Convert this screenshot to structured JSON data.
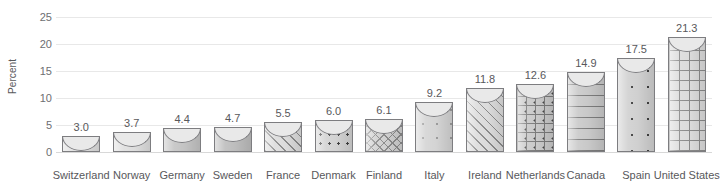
{
  "chart_data": {
    "type": "bar",
    "title": "",
    "xlabel": "",
    "ylabel": "Percent",
    "ylim": [
      0,
      25
    ],
    "yticks": [
      0,
      5,
      10,
      15,
      20,
      25
    ],
    "ytick_labels": [
      "0",
      "5",
      "10",
      "15",
      "20",
      "25"
    ],
    "grid": true,
    "legend": "none",
    "categories": [
      "Switzerland",
      "Norway",
      "Germany",
      "Sweden",
      "France",
      "Denmark",
      "Finland",
      "Italy",
      "Ireland",
      "Netherlands",
      "Canada",
      "Spain",
      "United States"
    ],
    "values": [
      3.0,
      3.7,
      4.4,
      4.7,
      5.5,
      6.0,
      6.1,
      9.2,
      11.8,
      12.6,
      14.9,
      17.5,
      21.3
    ],
    "value_labels": [
      "3.0",
      "3.7",
      "4.4",
      "4.7",
      "5.5",
      "6.0",
      "6.1",
      "9.2",
      "11.8",
      "12.6",
      "14.9",
      "17.5",
      "21.3"
    ],
    "bar_patterns": [
      "plain-light",
      "plain-light",
      "solid-medium",
      "solid-dark",
      "diagonal-stripes",
      "dots",
      "diagonal-crosshatch",
      "plus-marks",
      "diagonal-stripes-wide",
      "grid-with-dots",
      "horizontal-lines",
      "sparse-dots",
      "fine-grid"
    ]
  },
  "colors": {
    "text": "#58585b",
    "gridline": "#e8e8e8",
    "baseline": "#d8d8d8",
    "bar_outline": "#7d7d80",
    "background": "#ffffff"
  }
}
